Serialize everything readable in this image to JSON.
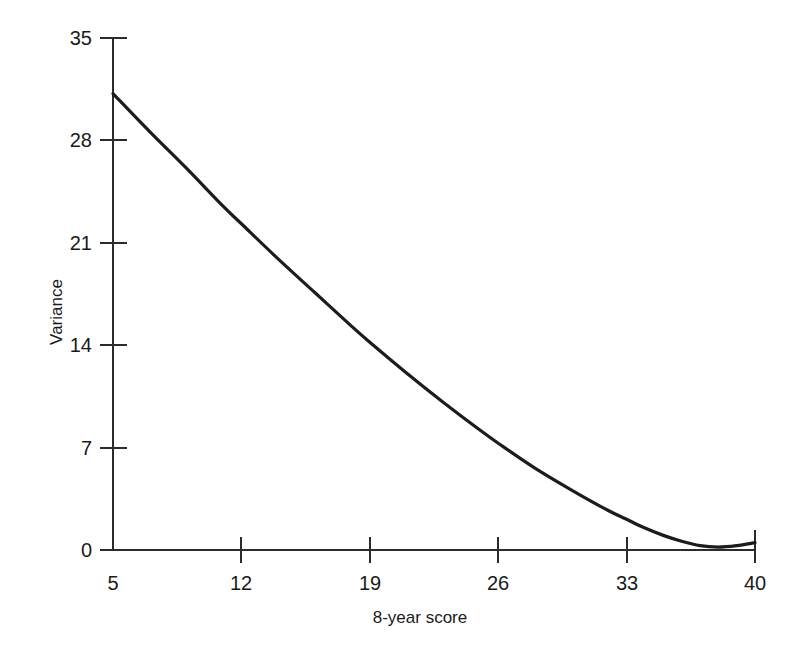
{
  "chart_data": {
    "type": "line",
    "title": "",
    "subtitle": "",
    "xlabel": "8-year score",
    "ylabel": "Variance",
    "xlim": [
      5,
      40
    ],
    "ylim": [
      0,
      35
    ],
    "grid": false,
    "legend": null,
    "x_ticks": [
      "5",
      "12",
      "19",
      "26",
      "33",
      "40"
    ],
    "x_tick_values": [
      5,
      12,
      19,
      26,
      33,
      40
    ],
    "y_ticks": [
      "0",
      "7",
      "14",
      "21",
      "28",
      "35"
    ],
    "y_tick_values": [
      0,
      7,
      14,
      21,
      28,
      35
    ],
    "series": [
      {
        "name": "Variance",
        "color": "#1c1c1c",
        "x": [
          5,
          7,
          9,
          11,
          12,
          14,
          16,
          18,
          19,
          21,
          23,
          25,
          26,
          28,
          30,
          32,
          33,
          34,
          35,
          36,
          37,
          38,
          39,
          40
        ],
        "values": [
          31.2,
          28.6,
          26.1,
          23.5,
          22.3,
          19.9,
          17.6,
          15.3,
          14.2,
          12.1,
          10.1,
          8.2,
          7.3,
          5.6,
          4.1,
          2.7,
          2.1,
          1.5,
          1.0,
          0.6,
          0.3,
          0.2,
          0.3,
          0.5
        ]
      }
    ],
    "annotations": []
  },
  "axes": {
    "x_axis_label": "8-year score",
    "y_axis_label": "Variance"
  }
}
